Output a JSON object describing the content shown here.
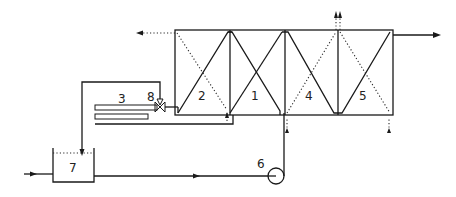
{
  "diagram": {
    "type": "process-flow-schematic",
    "colors": {
      "line": "#1a1a1a",
      "background": "#ffffff"
    },
    "labels": {
      "stage_1": "1",
      "stage_2": "2",
      "component_3": "3",
      "stage_4": "4",
      "stage_5": "5",
      "pump_6": "6",
      "tank_7": "7",
      "valve_8": "8"
    },
    "components": [
      {
        "id": "1",
        "kind": "unit-section",
        "line_style": "solid-cross"
      },
      {
        "id": "2",
        "kind": "unit-section",
        "line_style": "solid-and-dotted-diagonal"
      },
      {
        "id": "3",
        "kind": "heat-exchanger-tubes"
      },
      {
        "id": "4",
        "kind": "unit-section",
        "line_style": "solid-and-dotted-diagonal"
      },
      {
        "id": "5",
        "kind": "unit-section",
        "line_style": "solid-and-dotted-cross"
      },
      {
        "id": "6",
        "kind": "pump"
      },
      {
        "id": "7",
        "kind": "open-tank"
      },
      {
        "id": "8",
        "kind": "valve"
      }
    ],
    "flows": [
      {
        "from": "left-inlet",
        "to": "7",
        "style": "solid"
      },
      {
        "from": "7",
        "to": "6",
        "style": "solid"
      },
      {
        "from": "6",
        "to": "1",
        "style": "solid"
      },
      {
        "from": "8",
        "to": "7",
        "style": "solid"
      },
      {
        "from": "5",
        "to": "right-outlet",
        "style": "solid"
      },
      {
        "from": "2",
        "to": "left-outlet",
        "style": "dotted"
      },
      {
        "from": "4/5",
        "to": "top-outlets",
        "style": "dotted",
        "count": 2
      },
      {
        "from": "bottom-inlets",
        "to": "2,4,5",
        "style": "dotted",
        "count": 3
      }
    ]
  }
}
